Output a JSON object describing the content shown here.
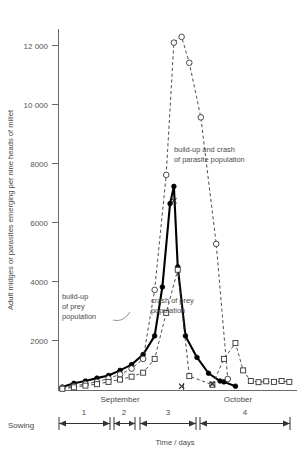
{
  "chart_data": {
    "type": "line",
    "title": "",
    "xlabel": "Time / days",
    "ylabel": "Adult midges or parasites emerging per nine heads of millet",
    "ylim": [
      0,
      13000
    ],
    "yticks": [
      2000,
      4000,
      6000,
      8000,
      10000,
      12000
    ],
    "ytick_labels": [
      "2000",
      "4000",
      "6000",
      "8000",
      "10 000",
      "12 000"
    ],
    "grid": false,
    "legend_position": "none",
    "xlim": [
      0,
      62
    ],
    "x_unit": "days from sowing",
    "month_labels": [
      "September",
      "October"
    ],
    "interval_labels": [
      "1",
      "2",
      "3",
      "4"
    ],
    "origin_label": "Sowing",
    "series": [
      {
        "name": "prey population (adult midges)",
        "marker": "filled-circle",
        "line": "solid-thick",
        "x": [
          1,
          4,
          7,
          10,
          13,
          16,
          19,
          22,
          25,
          27,
          29,
          30,
          31,
          33,
          36,
          39,
          42,
          43,
          46
        ],
        "values": [
          120,
          250,
          330,
          430,
          520,
          700,
          900,
          1250,
          1900,
          3600,
          6500,
          7100,
          4300,
          1900,
          1150,
          600,
          330,
          300,
          150
        ]
      },
      {
        "name": "parasite population",
        "marker": "open-circle",
        "line": "dashed",
        "x": [
          1,
          4,
          7,
          10,
          13,
          16,
          19,
          22,
          25,
          28,
          30,
          32,
          34,
          37,
          41,
          44
        ],
        "values": [
          90,
          150,
          230,
          300,
          420,
          560,
          760,
          1100,
          3500,
          7500,
          12100,
          12300,
          11400,
          9500,
          5100,
          400
        ]
      },
      {
        "name": "secondary parasite counts",
        "marker": "open-square",
        "line": "dashed",
        "x": [
          1,
          4,
          7,
          10,
          13,
          16,
          19,
          22,
          25,
          28,
          31,
          34,
          40,
          43,
          46,
          48,
          50,
          52,
          54,
          56,
          58,
          60
        ],
        "values": [
          60,
          110,
          170,
          220,
          300,
          380,
          480,
          620,
          1100,
          2700,
          4200,
          500,
          200,
          1100,
          1650,
          700,
          330,
          290,
          320,
          300,
          330,
          300
        ]
      },
      {
        "name": "cross markers",
        "marker": "cross",
        "line": "none",
        "x": [
          30,
          32,
          40
        ],
        "values": [
          6600,
          150,
          230
        ]
      }
    ],
    "annotations": [
      {
        "id": "build-up-prey",
        "lines": [
          "build-up",
          "of prey",
          "population"
        ]
      },
      {
        "id": "crash-prey",
        "lines": [
          "crash of prey",
          "population"
        ]
      },
      {
        "id": "parasite-cycle",
        "lines": [
          "build-up and crash",
          "of parasite population"
        ]
      }
    ]
  }
}
